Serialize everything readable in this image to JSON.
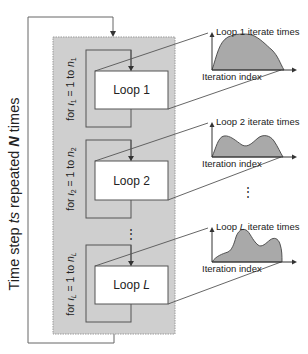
{
  "outer_loop": {
    "label_prefix": "Time step ",
    "label_var": "ts",
    "label_mid": " repeated ",
    "label_N": "N",
    "label_suffix": " times"
  },
  "loops": [
    {
      "box_label_prefix": "Loop ",
      "box_label_var": "1",
      "var_italic": false,
      "for_prefix": "for ",
      "for_iota": "ι",
      "for_sub": "1",
      "for_mid": " = 1 to ",
      "for_n": "n",
      "for_nsub": "1",
      "chart": {
        "ylabel_prefix": "Loop ",
        "ylabel_var": "1",
        "ylabel_suffix": " iterate times",
        "xlabel": "Iteration index"
      }
    },
    {
      "box_label_prefix": "Loop ",
      "box_label_var": "2",
      "var_italic": false,
      "for_prefix": "for ",
      "for_iota": "ι",
      "for_sub": "2",
      "for_mid": " = 1 to ",
      "for_n": "n",
      "for_nsub": "2",
      "chart": {
        "ylabel_prefix": "Loop ",
        "ylabel_var": "2",
        "ylabel_suffix": " iterate times",
        "xlabel": "Iteration index"
      }
    },
    {
      "box_label_prefix": "Loop ",
      "box_label_var": "L",
      "var_italic": true,
      "for_prefix": "for ",
      "for_iota": "ι",
      "for_sub": "L",
      "for_mid": " = 1 to ",
      "for_n": "n",
      "for_nsub": "L",
      "chart": {
        "ylabel_prefix": "Loop ",
        "ylabel_var": "L",
        "ylabel_suffix": " iterate times",
        "xlabel": "Iteration index"
      }
    }
  ],
  "ellipsis": "⋮",
  "colors": {
    "panel_fill": "#cfcfcf",
    "panel_border": "#9a9a9a",
    "line": "#555555",
    "curve_fill": "#a9a9a9",
    "box_fill": "#ffffff"
  }
}
